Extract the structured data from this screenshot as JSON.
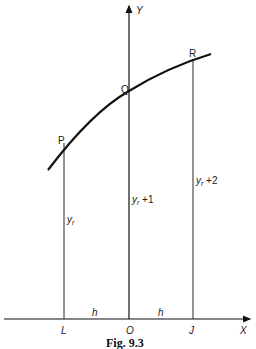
{
  "figure": {
    "caption": "Fig. 9.3",
    "axes": {
      "x_label": "X",
      "y_label": "Y"
    },
    "points": [
      {
        "name": "P",
        "label": "P"
      },
      {
        "name": "Q",
        "label": "Q"
      },
      {
        "name": "R",
        "label": "R"
      }
    ],
    "feet": {
      "left": "L",
      "origin": "O",
      "right": "J"
    },
    "ordinates": {
      "left": "y_r",
      "middle": "y_r+1",
      "right": "y_r+2"
    },
    "ordinate_display": {
      "left_base": "y",
      "left_sub": "r",
      "middle_base": "y",
      "middle_sub": "r",
      "middle_tail": " +1",
      "right_base": "y",
      "right_sub": "r",
      "right_tail": " +2"
    },
    "spacing_labels": {
      "left": "h",
      "right": "h"
    }
  }
}
